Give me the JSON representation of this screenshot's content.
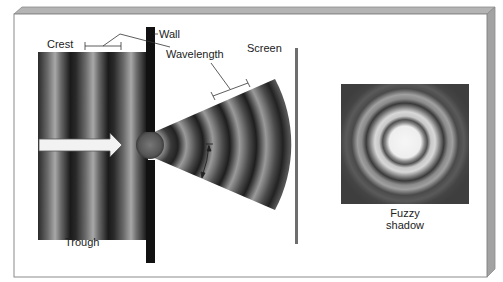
{
  "diagram": {
    "labels": {
      "crest": "Crest",
      "wall": "Wall",
      "wavelength": "Wavelength",
      "screen": "Screen",
      "trough": "Trough",
      "fuzzy_shadow_line1": "Fuzzy",
      "fuzzy_shadow_line2": "shadow"
    },
    "elements": [
      {
        "id": "plane-waves",
        "description": "Incoming plane wavefronts (alternating crests and troughs)"
      },
      {
        "id": "direction-arrow",
        "description": "White arrow showing wave propagation direction to the right"
      },
      {
        "id": "wall",
        "description": "Black vertical wall with small aperture"
      },
      {
        "id": "diffracted-waves",
        "description": "Circular wavefronts spreading out in a fan from the aperture"
      },
      {
        "id": "angle-arrow",
        "description": "Curved double-headed arrow indicating spread angle"
      },
      {
        "id": "screen",
        "description": "Gray vertical screen line"
      },
      {
        "id": "diffraction-pattern",
        "description": "Concentric bright/dark rings (Airy pattern)"
      }
    ],
    "colors": {
      "panel_face": "#ffffff",
      "panel_bevel": "#a8a8a8",
      "panel_border": "#8a8a8a",
      "wall": "#111111",
      "screen": "#6e6e6e",
      "wave_dark": "#1a1a1a",
      "wave_light": "#9a9a9a",
      "arrow_fill": "#f2f2f2",
      "ring_bright": "#f4f4f4",
      "ring_bg": "#4a4a4a"
    }
  }
}
